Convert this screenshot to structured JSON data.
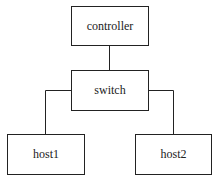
{
  "diagram": {
    "type": "network-topology",
    "nodes": [
      {
        "id": "controller",
        "label": "controller"
      },
      {
        "id": "switch",
        "label": "switch"
      },
      {
        "id": "host1",
        "label": "host1"
      },
      {
        "id": "host2",
        "label": "host2"
      }
    ],
    "edges": [
      {
        "from": "controller",
        "to": "switch"
      },
      {
        "from": "switch",
        "to": "host1"
      },
      {
        "from": "switch",
        "to": "host2"
      }
    ],
    "colors": {
      "line": "#222222",
      "background": "#ffffff"
    }
  }
}
